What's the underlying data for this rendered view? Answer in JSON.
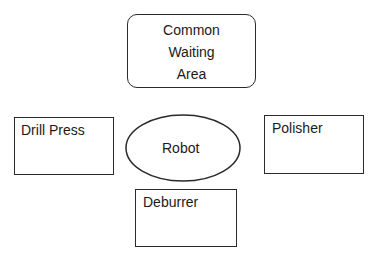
{
  "diagram": {
    "nodes": {
      "waiting_area": {
        "lines": [
          "Common",
          "Waiting",
          "Area"
        ],
        "shape": "rounded-rectangle"
      },
      "drill_press": {
        "label": "Drill Press",
        "shape": "rectangle"
      },
      "robot": {
        "label": "Robot",
        "shape": "ellipse"
      },
      "polisher": {
        "label": "Polisher",
        "shape": "rectangle"
      },
      "deburrer": {
        "label": "Deburrer",
        "shape": "rectangle"
      }
    },
    "colors": {
      "stroke": "#2a2a2a",
      "text": "#1a1a1a",
      "background": "#ffffff"
    }
  }
}
